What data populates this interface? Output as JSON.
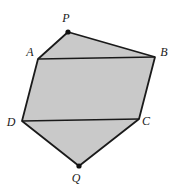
{
  "figure": {
    "background_color": "#ffffff",
    "fill_color": "#c9c9c9",
    "stroke_color": "#1a1a1a",
    "marker_color": "#111111",
    "outline_width": 1.8,
    "chord_width": 1.4
  },
  "labels": {
    "P": "P",
    "A": "A",
    "B": "B",
    "C": "C",
    "D": "D",
    "Q": "Q"
  },
  "chart_data": {
    "type": "scatter",
    "xlabel": "",
    "ylabel": "",
    "xlim": [
      0,
      180
    ],
    "ylim": [
      0,
      190
    ],
    "grid": false,
    "legend": "none",
    "points": [
      {
        "name": "P",
        "x": 68,
        "y": 32,
        "label": "P",
        "label_x": 66,
        "label_y": 22,
        "marker": "dot"
      },
      {
        "name": "A",
        "x": 38,
        "y": 59,
        "label": "A",
        "label_x": 30,
        "label_y": 56,
        "marker": "none"
      },
      {
        "name": "B",
        "x": 155,
        "y": 57,
        "label": "B",
        "label_x": 164,
        "label_y": 56,
        "marker": "none"
      },
      {
        "name": "C",
        "x": 139,
        "y": 119,
        "label": "C",
        "label_x": 146,
        "label_y": 125,
        "marker": "none"
      },
      {
        "name": "D",
        "x": 22,
        "y": 121,
        "label": "D",
        "label_x": 11,
        "label_y": 126,
        "marker": "none"
      },
      {
        "name": "Q",
        "x": 79,
        "y": 166,
        "label": "Q",
        "label_x": 76,
        "label_y": 182,
        "marker": "dot"
      }
    ],
    "polygons": [
      {
        "name": "outer-hexagon",
        "vertices": [
          "P",
          "B",
          "C",
          "Q",
          "D",
          "A"
        ],
        "points": "68,32 155,57 139,119 79,166 22,121 38,59",
        "fill": "#c9c9c9",
        "stroke": "#1a1a1a"
      }
    ],
    "chords": [
      {
        "name": "segment-AB",
        "from": "A",
        "to": "B",
        "x1": 38,
        "y1": 59,
        "x2": 155,
        "y2": 57
      },
      {
        "name": "segment-DC",
        "from": "D",
        "to": "C",
        "x1": 22,
        "y1": 121,
        "x2": 139,
        "y2": 119
      }
    ]
  }
}
